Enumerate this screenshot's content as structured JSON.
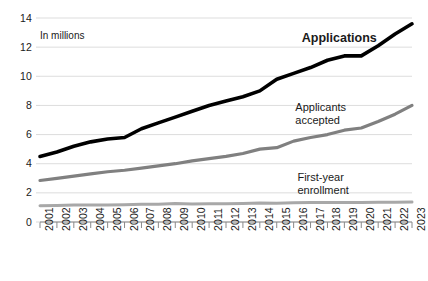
{
  "chart_data": {
    "type": "line",
    "title": "",
    "subtitle": "",
    "unit_note": "In millions",
    "xlabel": "",
    "ylabel": "",
    "grid": true,
    "legend_position": "inline-annotations",
    "ylim": [
      0,
      14
    ],
    "yticks": [
      0,
      2,
      4,
      6,
      8,
      10,
      12,
      14
    ],
    "ytick_labels": [
      "0",
      "2",
      "4",
      "6",
      "8",
      "10",
      "12",
      "14"
    ],
    "categories": [
      "2001",
      "2002",
      "2003",
      "2004",
      "2005",
      "2006",
      "2007",
      "2008",
      "2009",
      "2010",
      "2011",
      "2012",
      "2013",
      "2014",
      "2015",
      "2016",
      "2017",
      "2018",
      "2019",
      "2020",
      "2021",
      "2022",
      "2023"
    ],
    "series": [
      {
        "name": "Applications",
        "color": "#000000",
        "width": 3.6,
        "label_bold": true,
        "values": [
          4.5,
          4.8,
          5.2,
          5.5,
          5.7,
          5.8,
          6.4,
          6.8,
          7.2,
          7.6,
          8.0,
          8.3,
          8.6,
          9.0,
          9.8,
          10.2,
          10.6,
          11.1,
          11.4,
          11.4,
          12.1,
          12.9,
          13.6
        ]
      },
      {
        "name": "Applicants\naccepted",
        "color": "#808080",
        "width": 3.2,
        "label_bold": false,
        "values": [
          2.85,
          3.0,
          3.15,
          3.3,
          3.45,
          3.55,
          3.7,
          3.85,
          4.0,
          4.2,
          4.35,
          4.5,
          4.7,
          5.0,
          5.1,
          5.55,
          5.8,
          6.0,
          6.3,
          6.45,
          6.9,
          7.4,
          8.0
        ]
      },
      {
        "name": "First-year\nenrollment",
        "color": "#a8a8a8",
        "width": 3.0,
        "label_bold": false,
        "values": [
          1.12,
          1.13,
          1.16,
          1.17,
          1.17,
          1.19,
          1.21,
          1.22,
          1.27,
          1.24,
          1.25,
          1.26,
          1.27,
          1.3,
          1.28,
          1.32,
          1.33,
          1.33,
          1.34,
          1.33,
          1.35,
          1.36,
          1.37
        ]
      }
    ],
    "annotations": [
      {
        "text": "Applications",
        "x_pct": 70.5,
        "y_pct": 11.0,
        "bold": true
      },
      {
        "text": "Applicants\naccepted",
        "x_pct": 69.0,
        "y_pct": 36.0,
        "bold": false
      },
      {
        "text": "First-year\nenrollment",
        "x_pct": 69.5,
        "y_pct": 61.0,
        "bold": false
      }
    ],
    "colors": {
      "applications": "#000000",
      "applicants_accepted": "#808080",
      "first_year_enrollment": "#a8a8a8",
      "gridline": "#d9d9d9",
      "axis": "#8a8a8a",
      "text": "#1a1a1a",
      "background": "#ffffff"
    }
  }
}
